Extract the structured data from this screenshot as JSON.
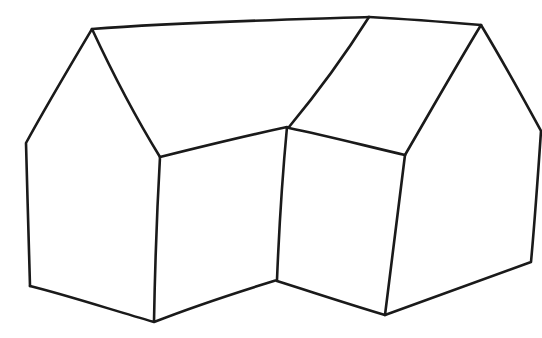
{
  "colors": {
    "background": "#ffffff",
    "ink": "#1a1a1a"
  },
  "drawing": {
    "style": "hand-drawn pen line art",
    "parts": [
      {
        "name": "left-gable-end",
        "points": [
          [
            28,
            285
          ],
          [
            26,
            142
          ],
          [
            92,
            28
          ],
          [
            160,
            157
          ],
          [
            153,
            322
          ]
        ]
      },
      {
        "name": "left-front-wall",
        "points": [
          [
            160,
            157
          ],
          [
            288,
            128
          ],
          [
            276,
            280
          ],
          [
            153,
            322
          ]
        ]
      },
      {
        "name": "left-roof-plane",
        "points": [
          [
            92,
            28
          ],
          [
            369,
            17
          ],
          [
            288,
            128
          ],
          [
            160,
            157
          ]
        ]
      },
      {
        "name": "right-roof-plane",
        "points": [
          [
            369,
            17
          ],
          [
            481,
            25
          ],
          [
            405,
            155
          ],
          [
            288,
            128
          ]
        ]
      },
      {
        "name": "right-front-wall",
        "points": [
          [
            288,
            128
          ],
          [
            405,
            155
          ],
          [
            385,
            315
          ],
          [
            276,
            280
          ]
        ]
      },
      {
        "name": "right-gable-end",
        "points": [
          [
            405,
            155
          ],
          [
            481,
            25
          ],
          [
            541,
            131
          ],
          [
            530,
            262
          ],
          [
            385,
            315
          ]
        ]
      }
    ]
  }
}
